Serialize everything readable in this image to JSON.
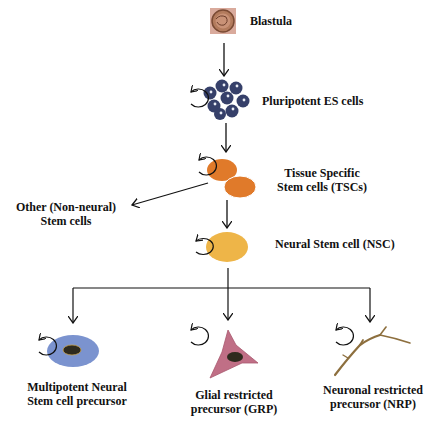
{
  "diagram": {
    "nodes": {
      "blastula": {
        "label": "Blastula"
      },
      "es_cells": {
        "label": "Pluripotent ES cells"
      },
      "tsc": {
        "label_line1": "Tissue Specific",
        "label_line2": "Stem cells (TSCs)"
      },
      "other": {
        "label_line1": "Other (Non-neural)",
        "label_line2": "Stem cells"
      },
      "nsc": {
        "label": "Neural Stem cell (NSC)"
      },
      "multipotent": {
        "label_line1": "Multipotent Neural",
        "label_line2": "Stem cell precursor"
      },
      "grp": {
        "label_line1": "Glial restricted",
        "label_line2": "precursor (GRP)"
      },
      "nrp": {
        "label_line1": "Neuronal restricted",
        "label_line2": "precursor (NRP)"
      }
    },
    "edges": [
      [
        "Blastula",
        "Pluripotent ES cells"
      ],
      [
        "Pluripotent ES cells",
        "Tissue Specific Stem cells (TSCs)"
      ],
      [
        "Tissue Specific Stem cells (TSCs)",
        "Other (Non-neural) Stem cells"
      ],
      [
        "Tissue Specific Stem cells (TSCs)",
        "Neural Stem cell (NSC)"
      ],
      [
        "Neural Stem cell (NSC)",
        "Multipotent Neural Stem cell precursor"
      ],
      [
        "Neural Stem cell (NSC)",
        "Glial restricted precursor (GRP)"
      ],
      [
        "Neural Stem cell (NSC)",
        "Neuronal restricted precursor (NRP)"
      ]
    ],
    "colors": {
      "blastula_bg": "#d7a89c",
      "es_cells": "#36406a",
      "tsc": "#e07a2a",
      "nsc": "#eeb548",
      "multipotent": "#7b93cf",
      "grp": "#c06f86",
      "nrp": "#b79a6a",
      "nucleus": "#2e2a1e"
    }
  }
}
